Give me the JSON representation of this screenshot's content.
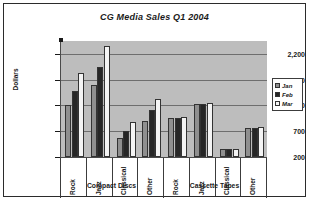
{
  "chart_data": {
    "type": "bar",
    "title": "CG Media Sales Q1 2004",
    "xlabel": "",
    "ylabel": "Dollars",
    "ylim": [
      200,
      2450
    ],
    "yticks": [
      200,
      700,
      1200,
      1700,
      2200
    ],
    "ytick_labels": [
      "200",
      "700",
      "1,200",
      "1,700",
      "2,200"
    ],
    "grid": true,
    "legend_position": "right",
    "categories": [
      "Rock",
      "Jazz",
      "Classical",
      "Other",
      "Rock",
      "Jazz",
      "Classical",
      "Other"
    ],
    "groups": [
      {
        "label": "Compact Discs",
        "categories": [
          "Rock",
          "Jazz",
          "Classical",
          "Other"
        ]
      },
      {
        "label": "Cassette Tapes",
        "categories": [
          "Rock",
          "Jazz",
          "Classical",
          "Other"
        ]
      }
    ],
    "series": [
      {
        "name": "Jan",
        "color": "#8f8f8f",
        "values": [
          1200,
          1600,
          560,
          900,
          960,
          1220,
          350,
          760
        ]
      },
      {
        "name": "Feb",
        "color": "#262626",
        "values": [
          1480,
          1950,
          700,
          1120,
          960,
          1230,
          350,
          760
        ]
      },
      {
        "name": "Mar",
        "color": "#f4f4f4",
        "values": [
          1830,
          2350,
          880,
          1330,
          980,
          1240,
          350,
          780
        ]
      }
    ]
  },
  "legend": {
    "items": [
      {
        "label": "Jan",
        "color": "#8f8f8f"
      },
      {
        "label": "Feb",
        "color": "#262626"
      },
      {
        "label": "Mar",
        "color": "#f4f4f4"
      }
    ]
  }
}
